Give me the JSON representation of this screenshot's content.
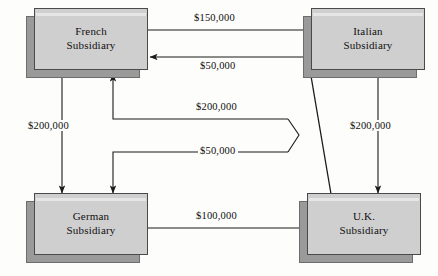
{
  "diagram": {
    "nodes": [
      {
        "id": "french",
        "label_line1": "French",
        "label_line2": "Subsidiary"
      },
      {
        "id": "italian",
        "label_line1": "Italian",
        "label_line2": "Subsidiary"
      },
      {
        "id": "german",
        "label_line1": "German",
        "label_line2": "Subsidiary"
      },
      {
        "id": "uk",
        "label_line1": "U.K.",
        "label_line2": "Subsidiary"
      }
    ],
    "flows": [
      {
        "id": "french-to-italian",
        "amount": "$150,000",
        "from": "French Subsidiary",
        "to": "Italian Subsidiary"
      },
      {
        "id": "italian-to-french",
        "amount": "$50,000",
        "from": "Italian Subsidiary",
        "to": "French Subsidiary"
      },
      {
        "id": "uk-to-french",
        "amount": "$200,000",
        "from": "U.K. Subsidiary",
        "to": "French Subsidiary"
      },
      {
        "id": "italian-to-german",
        "amount": "$50,000",
        "from": "Italian Subsidiary",
        "to": "German Subsidiary"
      },
      {
        "id": "french-to-german",
        "amount": "$200,000",
        "from": "French Subsidiary",
        "to": "German Subsidiary"
      },
      {
        "id": "italian-to-uk",
        "amount": "$200,000",
        "from": "Italian Subsidiary",
        "to": "U.K. Subsidiary"
      },
      {
        "id": "german-to-uk",
        "amount": "$100,000",
        "from": "German Subsidiary",
        "to": "U.K. Subsidiary"
      }
    ],
    "colors": {
      "node_fill": "#cfcfcf",
      "node_border": "#4a4a4a",
      "shadow": "#9a9a9a",
      "line": "#1a1a1a",
      "background": "#fdfdfb"
    }
  }
}
